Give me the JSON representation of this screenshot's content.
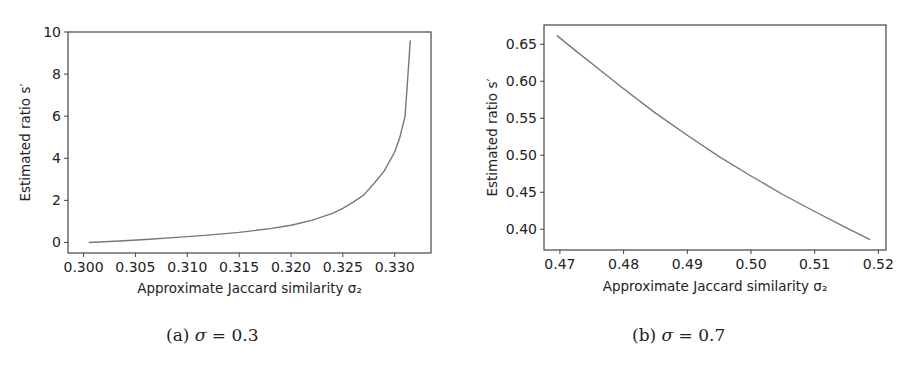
{
  "chart_data": [
    {
      "type": "line",
      "panel": "a",
      "caption": {
        "label": "(a)",
        "symbol": "σ",
        "eq": " = 0.3"
      },
      "title": "",
      "xlabel": "Approximate Jaccard similarity σ₂",
      "ylabel": "Estimated ratio s′",
      "xlim": [
        0.2985,
        0.3335
      ],
      "ylim": [
        -0.5,
        10.0
      ],
      "xticks": [
        0.3,
        0.305,
        0.31,
        0.315,
        0.32,
        0.325,
        0.33
      ],
      "xtick_labels": [
        "0.300",
        "0.305",
        "0.310",
        "0.315",
        "0.320",
        "0.325",
        "0.330"
      ],
      "yticks": [
        0,
        2,
        4,
        6,
        8,
        10
      ],
      "ytick_labels": [
        "0",
        "2",
        "4",
        "6",
        "8",
        "10"
      ],
      "grid": false,
      "legend": null,
      "series": [
        {
          "name": "s′",
          "color": "#777777",
          "x": [
            0.3005,
            0.303,
            0.306,
            0.309,
            0.312,
            0.315,
            0.318,
            0.32,
            0.322,
            0.324,
            0.325,
            0.326,
            0.327,
            0.328,
            0.329,
            0.33,
            0.3305,
            0.331,
            0.3315
          ],
          "y": [
            0.0,
            0.06,
            0.14,
            0.24,
            0.35,
            0.48,
            0.66,
            0.82,
            1.05,
            1.38,
            1.62,
            1.92,
            2.25,
            2.8,
            3.4,
            4.3,
            5.0,
            6.0,
            9.6
          ]
        }
      ]
    },
    {
      "type": "line",
      "panel": "b",
      "caption": {
        "label": "(b)",
        "symbol": "σ",
        "eq": " = 0.7"
      },
      "title": "",
      "xlabel": "Approximate Jaccard similarity σ₂",
      "ylabel": "Estimated ratio s′",
      "xlim": [
        0.4675,
        0.5212
      ],
      "ylim": [
        0.372,
        0.676
      ],
      "xticks": [
        0.47,
        0.48,
        0.49,
        0.5,
        0.51,
        0.52
      ],
      "xtick_labels": [
        "0.47",
        "0.48",
        "0.49",
        "0.50",
        "0.51",
        "0.52"
      ],
      "yticks": [
        0.4,
        0.45,
        0.5,
        0.55,
        0.6,
        0.65
      ],
      "ytick_labels": [
        "0.40",
        "0.45",
        "0.50",
        "0.55",
        "0.60",
        "0.65"
      ],
      "grid": false,
      "legend": null,
      "series": [
        {
          "name": "s′",
          "color": "#777777",
          "x": [
            0.4695,
            0.4725,
            0.475,
            0.48,
            0.485,
            0.49,
            0.495,
            0.5,
            0.505,
            0.51,
            0.515,
            0.5187
          ],
          "y": [
            0.662,
            0.641,
            0.624,
            0.59,
            0.557,
            0.527,
            0.498,
            0.472,
            0.447,
            0.424,
            0.402,
            0.386
          ]
        }
      ]
    }
  ]
}
